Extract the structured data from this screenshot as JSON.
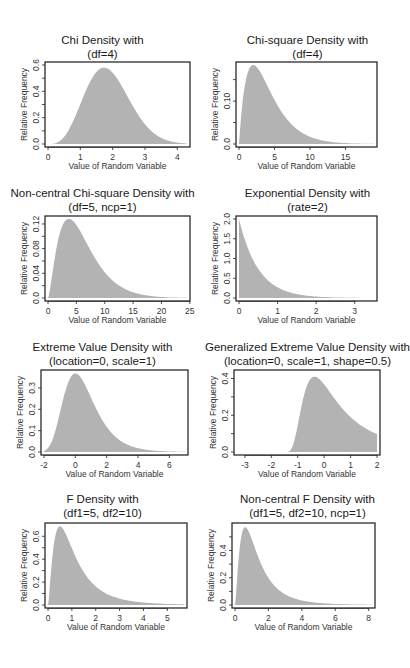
{
  "chart_data": [
    {
      "type": "area",
      "title": "Chi Density with",
      "subtitle": "(df=4)",
      "xlabel": "Value of Random Variable",
      "ylabel": "Relative Frequency",
      "dist": "chi",
      "params": {
        "df": 4
      },
      "xlim": [
        0,
        4.3
      ],
      "ylim": [
        0,
        0.6
      ],
      "xticks": [
        0,
        1,
        2,
        3,
        4
      ],
      "xtick_labels": [
        "0",
        "1",
        "2",
        "3",
        "4"
      ],
      "yticks": [
        0.0,
        0.1,
        0.2,
        0.3,
        0.4,
        0.5,
        0.6
      ],
      "ytick_labels": [
        "0.0",
        "",
        "0.2",
        "",
        "0.4",
        "",
        "0.6"
      ],
      "peak": {
        "x": 1.73,
        "y": 0.58
      },
      "show_xlabel": true
    },
    {
      "type": "area",
      "title": "Chi-square Density with",
      "subtitle": "(df=4)",
      "xlabel": "Value of Random Variable",
      "ylabel": "Relative Frequency",
      "dist": "chisq",
      "params": {
        "df": 4
      },
      "xlim": [
        0,
        19
      ],
      "ylim": [
        0,
        0.184
      ],
      "xticks": [
        0,
        5,
        10,
        15
      ],
      "xtick_labels": [
        "0",
        "5",
        "10",
        "15"
      ],
      "yticks": [
        0.0,
        0.05,
        0.1,
        0.15
      ],
      "ytick_labels": [
        "0.0",
        "",
        "0.10",
        ""
      ],
      "peak": {
        "x": 2.0,
        "y": 0.184
      },
      "show_xlabel": true
    },
    {
      "type": "area",
      "title": "Non-central Chi-square Density with",
      "subtitle": "(df=5, ncp=1)",
      "xlabel": "Value of Random Variable",
      "ylabel": "Relative Frequency",
      "dist": "ncchisq",
      "params": {
        "df": 5,
        "ncp": 1
      },
      "xlim": [
        0,
        24.5
      ],
      "ylim": [
        0,
        0.128
      ],
      "xticks": [
        0,
        5,
        10,
        15,
        20,
        25
      ],
      "xtick_labels": [
        "0",
        "5",
        "10",
        "15",
        "20",
        "25"
      ],
      "yticks": [
        0.0,
        0.02,
        0.04,
        0.06,
        0.08,
        0.1,
        0.12
      ],
      "ytick_labels": [
        "0.0",
        "",
        "0.04",
        "",
        "0.08",
        "",
        "0.12"
      ],
      "peak": {
        "x": 3.9,
        "y": 0.127
      },
      "show_xlabel": true
    },
    {
      "type": "area",
      "title": "Exponential Density with",
      "subtitle": "(rate=2)",
      "xlabel": "Value of Random Variable",
      "ylabel": "Relative Frequency",
      "dist": "exp",
      "params": {
        "rate": 2
      },
      "xlim": [
        0,
        3.5
      ],
      "ylim": [
        0,
        2.0
      ],
      "xticks": [
        0,
        1,
        2,
        3
      ],
      "xtick_labels": [
        "0",
        "1",
        "2",
        "3"
      ],
      "yticks": [
        0.0,
        0.5,
        1.0,
        1.5,
        2.0
      ],
      "ytick_labels": [
        "0.0",
        "0.5",
        "1.0",
        "1.5",
        "2.0"
      ],
      "peak": {
        "x": 0,
        "y": 2.0
      },
      "show_xlabel": true
    },
    {
      "type": "area",
      "title": "Extreme Value Density with",
      "subtitle": "(location=0, scale=1)",
      "xlabel": "Value of Random Variable",
      "ylabel": "Relative Frequency",
      "dist": "gumbel",
      "params": {
        "location": 0,
        "scale": 1
      },
      "xlim": [
        -2,
        7
      ],
      "ylim": [
        0,
        0.37
      ],
      "xticks": [
        -2,
        0,
        2,
        4,
        6
      ],
      "xtick_labels": [
        "-2",
        "0",
        "2",
        "4",
        "6"
      ],
      "yticks": [
        0.0,
        0.1,
        0.2,
        0.3
      ],
      "ytick_labels": [
        "0.0",
        "0.1",
        "0.2",
        "0.3"
      ],
      "peak": {
        "x": 0,
        "y": 0.368
      },
      "show_xlabel": true
    },
    {
      "type": "area",
      "title": "Generalized Extreme Value Density with",
      "subtitle": "(location=0, scale=1, shape=0.5)",
      "xlabel": "Value of Random Variable",
      "ylabel": "Relative Frequency",
      "dist": "gev",
      "params": {
        "location": 0,
        "scale": 1,
        "shape": 0.5
      },
      "xlim": [
        -3.3,
        2
      ],
      "ylim": [
        0,
        0.43
      ],
      "xticks": [
        -3,
        -2,
        -1,
        0,
        1,
        2
      ],
      "xtick_labels": [
        "-3",
        "-2",
        "-1",
        "0",
        "1",
        "2"
      ],
      "yticks": [
        0.0,
        0.1,
        0.2,
        0.3,
        0.4
      ],
      "ytick_labels": [
        "0.0",
        "",
        "0.2",
        "",
        "0.4"
      ],
      "peak": {
        "x": 0.62,
        "y": 0.42
      },
      "show_xlabel": true
    },
    {
      "type": "area",
      "title": "F Density with",
      "subtitle": "(df1=5, df2=10)",
      "xlabel": "Value of Random Variable",
      "ylabel": "Relative Frequency",
      "dist": "f",
      "params": {
        "df1": 5,
        "df2": 10
      },
      "xlim": [
        0,
        5.7
      ],
      "ylim": [
        0,
        0.69
      ],
      "xticks": [
        0,
        1,
        2,
        3,
        4,
        5
      ],
      "xtick_labels": [
        "0",
        "1",
        "2",
        "3",
        "4",
        "5"
      ],
      "yticks": [
        0.0,
        0.1,
        0.2,
        0.3,
        0.4,
        0.5,
        0.6
      ],
      "ytick_labels": [
        "0.0",
        "",
        "0.2",
        "",
        "0.4",
        "",
        "0.6"
      ],
      "peak": {
        "x": 0.5,
        "y": 0.68
      },
      "show_xlabel": true
    },
    {
      "type": "area",
      "title": "Non-central F Density with",
      "subtitle": "(df1=5, df2=10, ncp=1)",
      "xlabel": "Value of Random Variable",
      "ylabel": "Relative Frequency",
      "dist": "ncf",
      "params": {
        "df1": 5,
        "df2": 10,
        "ncp": 1
      },
      "xlim": [
        0,
        8.2
      ],
      "ylim": [
        0,
        0.58
      ],
      "xticks": [
        0,
        2,
        4,
        6,
        8
      ],
      "xtick_labels": [
        "0",
        "2",
        "4",
        "6",
        "8"
      ],
      "yticks": [
        0.0,
        0.1,
        0.2,
        0.3,
        0.4,
        0.5
      ],
      "ytick_labels": [
        "0.0",
        "",
        "0.2",
        "",
        "0.4",
        ""
      ],
      "peak": {
        "x": 0.6,
        "y": 0.57
      },
      "show_xlabel": true
    }
  ],
  "style": {
    "fill_color": "#b3b3b3",
    "frame_color": "#1a1a1a",
    "text_color": "#333333"
  }
}
